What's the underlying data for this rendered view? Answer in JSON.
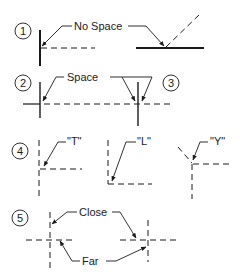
{
  "figure": {
    "sections": [
      {
        "number": "1",
        "label": "No Space"
      },
      {
        "number": "2",
        "label": "Space"
      },
      {
        "number": "3",
        "label": ""
      },
      {
        "number": "4",
        "labels": [
          "\"T\"",
          "\"L\"",
          "\"Y\""
        ]
      },
      {
        "number": "5",
        "labels": [
          "Close",
          "Far"
        ]
      }
    ]
  }
}
